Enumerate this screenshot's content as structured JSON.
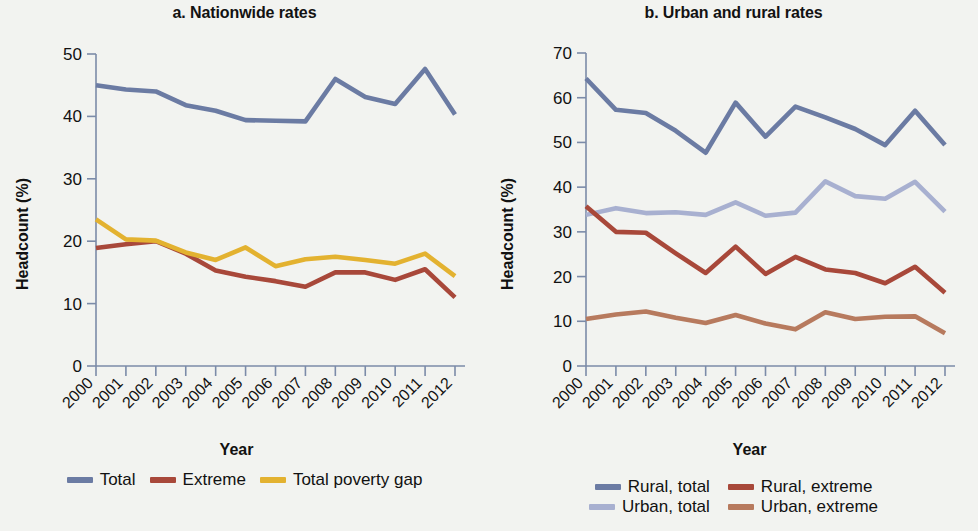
{
  "figure": {
    "background": "#f2f3f0"
  },
  "panels": [
    {
      "id": "panel-a",
      "title": "a. Nationwide rates",
      "ylabel": "Headcount (%)",
      "xlabel": "Year",
      "legend": [
        {
          "label": "Total",
          "color": "#6b7ba3"
        },
        {
          "label": "Extreme",
          "color": "#a8483a"
        },
        {
          "label": "Total poverty gap",
          "color": "#e3b230"
        }
      ]
    },
    {
      "id": "panel-b",
      "title": "b. Urban and rural rates",
      "ylabel": "Headcount (%)",
      "xlabel": "Year",
      "legend": [
        {
          "label": "Rural, total",
          "color": "#6b7ba3"
        },
        {
          "label": "Rural, extreme",
          "color": "#a8483a"
        },
        {
          "label": "Urban, total",
          "color": "#a8b0d0"
        },
        {
          "label": "Urban, extreme",
          "color": "#b77a5e"
        }
      ]
    }
  ],
  "chart_data": [
    {
      "type": "line",
      "title": "a. Nationwide rates",
      "xlabel": "Year",
      "ylabel": "Headcount (%)",
      "categories": [
        "2000",
        "2001",
        "2002",
        "2003",
        "2004",
        "2005",
        "2006",
        "2007",
        "2008",
        "2009",
        "2010",
        "2011",
        "2012"
      ],
      "x": [
        2000,
        2001,
        2002,
        2003,
        2004,
        2005,
        2006,
        2007,
        2008,
        2009,
        2010,
        2011,
        2012
      ],
      "ylim": [
        0,
        50
      ],
      "yticks": [
        0,
        10,
        20,
        30,
        40,
        50
      ],
      "grid": false,
      "legend_position": "bottom",
      "series": [
        {
          "name": "Total",
          "color": "#6b7ba3",
          "values": [
            45.0,
            44.3,
            44.0,
            41.8,
            40.9,
            39.4,
            39.3,
            39.2,
            46.0,
            43.1,
            42.0,
            47.6,
            40.3
          ]
        },
        {
          "name": "Extreme",
          "color": "#a8483a",
          "values": [
            18.9,
            19.5,
            20.0,
            18.0,
            15.3,
            14.3,
            13.6,
            12.7,
            15.0,
            15.0,
            13.8,
            15.5,
            11.0
          ]
        },
        {
          "name": "Total poverty gap",
          "color": "#e3b230",
          "values": [
            23.5,
            20.3,
            20.1,
            18.2,
            17.0,
            19.0,
            16.0,
            17.1,
            17.5,
            17.0,
            16.4,
            18.0,
            14.4
          ]
        }
      ]
    },
    {
      "type": "line",
      "title": "b. Urban and rural rates",
      "xlabel": "Year",
      "ylabel": "Headcount (%)",
      "categories": [
        "2000",
        "2001",
        "2002",
        "2003",
        "2004",
        "2005",
        "2006",
        "2007",
        "2008",
        "2009",
        "2010",
        "2011",
        "2012"
      ],
      "x": [
        2000,
        2001,
        2002,
        2003,
        2004,
        2005,
        2006,
        2007,
        2008,
        2009,
        2010,
        2011,
        2012
      ],
      "ylim": [
        0,
        70
      ],
      "yticks": [
        0,
        10,
        20,
        30,
        40,
        50,
        60,
        70
      ],
      "grid": false,
      "legend_position": "bottom",
      "series": [
        {
          "name": "Rural, total",
          "color": "#6b7ba3",
          "values": [
            64.3,
            57.3,
            56.6,
            52.6,
            47.7,
            58.9,
            51.3,
            58.0,
            55.6,
            53.0,
            49.4,
            57.1,
            49.4
          ]
        },
        {
          "name": "Urban, total",
          "color": "#a8b0d0",
          "values": [
            33.8,
            35.3,
            34.2,
            34.4,
            33.8,
            36.6,
            33.6,
            34.3,
            41.3,
            38.0,
            37.4,
            41.2,
            34.5
          ]
        },
        {
          "name": "Rural, extreme",
          "color": "#a8483a",
          "values": [
            35.7,
            30.0,
            29.8,
            25.2,
            20.8,
            26.7,
            20.6,
            24.4,
            21.6,
            20.8,
            18.5,
            22.2,
            16.4
          ]
        },
        {
          "name": "Urban, extreme",
          "color": "#b77a5e",
          "values": [
            10.5,
            11.5,
            12.2,
            10.8,
            9.6,
            11.4,
            9.5,
            8.2,
            12.0,
            10.5,
            11.0,
            11.1,
            7.3
          ]
        }
      ]
    }
  ]
}
